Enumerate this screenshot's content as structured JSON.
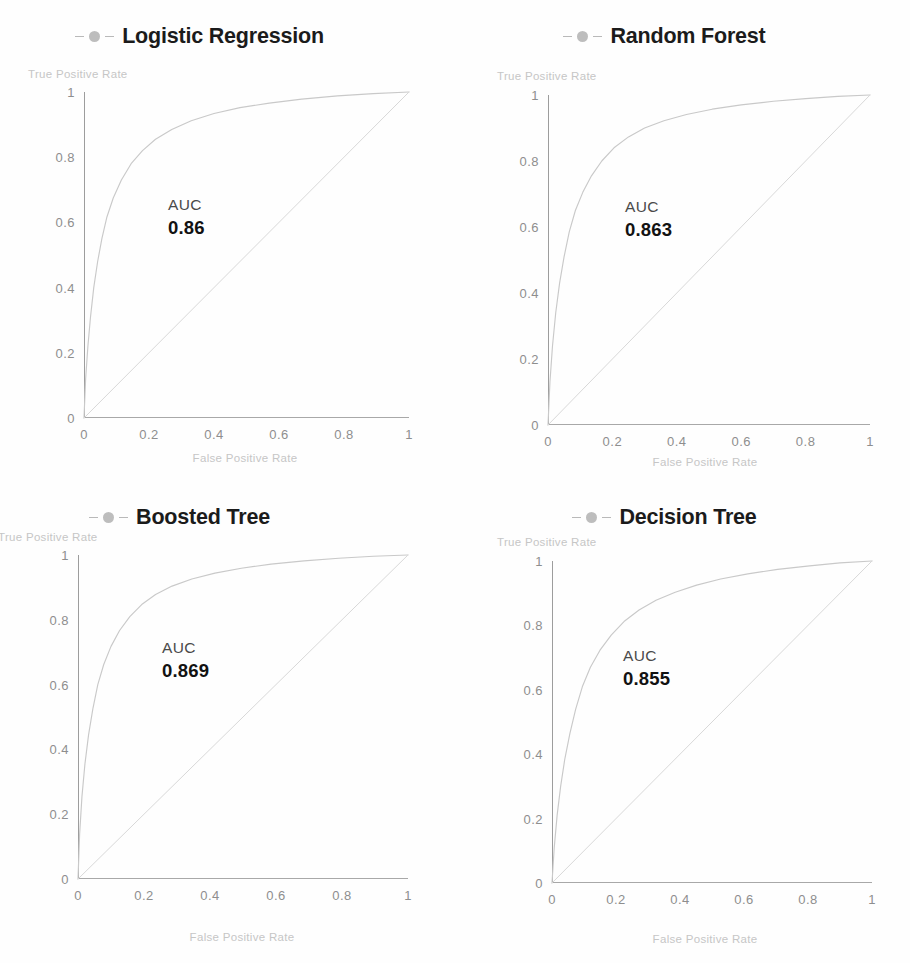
{
  "figure": {
    "background": "#ffffff",
    "curve_color": "#c9c9c9",
    "diagonal_color": "#d8d8d8",
    "axis_color": "#9d9d9d",
    "tick_color": "#8e8e8e",
    "axis_label_color": "#c6c6c6",
    "legend_marker_color": "#b2b2b2",
    "auc_label": "AUC"
  },
  "chart_data": [
    {
      "type": "line",
      "title": "Logistic Regression",
      "xlabel": "False Positive Rate",
      "ylabel": "True Positive Rate",
      "xlim": [
        0,
        1
      ],
      "ylim": [
        0,
        1
      ],
      "xticks": [
        "0",
        "0.2",
        "0.4",
        "0.6",
        "0.8",
        "1"
      ],
      "yticks": [
        "0",
        "0.2",
        "0.4",
        "0.6",
        "0.8",
        "1"
      ],
      "grid": false,
      "legend_position": "top-center",
      "annotations": {
        "auc_label": "AUC",
        "auc_value": "0.86"
      },
      "series": [
        {
          "name": "ROC curve",
          "x": [
            0,
            0.005,
            0.012,
            0.02,
            0.03,
            0.042,
            0.055,
            0.07,
            0.09,
            0.115,
            0.145,
            0.18,
            0.22,
            0.27,
            0.33,
            0.4,
            0.48,
            0.57,
            0.67,
            0.78,
            0.89,
            1.0
          ],
          "y": [
            0,
            0.12,
            0.22,
            0.31,
            0.4,
            0.48,
            0.55,
            0.615,
            0.675,
            0.73,
            0.78,
            0.82,
            0.855,
            0.885,
            0.912,
            0.934,
            0.952,
            0.966,
            0.978,
            0.988,
            0.995,
            1.0
          ]
        },
        {
          "name": "Chance diagonal",
          "x": [
            0,
            1
          ],
          "y": [
            0,
            1
          ]
        }
      ]
    },
    {
      "type": "line",
      "title": "Random Forest",
      "xlabel": "False Positive Rate",
      "ylabel": "True Positive Rate",
      "xlim": [
        0,
        1
      ],
      "ylim": [
        0,
        1
      ],
      "xticks": [
        "0",
        "0.2",
        "0.4",
        "0.6",
        "0.8",
        "1"
      ],
      "yticks": [
        "0",
        "0.2",
        "0.4",
        "0.6",
        "0.8",
        "1"
      ],
      "grid": false,
      "legend_position": "top-center",
      "annotations": {
        "auc_label": "AUC",
        "auc_value": "0.863"
      },
      "series": [
        {
          "name": "ROC curve",
          "x": [
            0,
            0.006,
            0.014,
            0.024,
            0.036,
            0.05,
            0.066,
            0.085,
            0.108,
            0.135,
            0.167,
            0.205,
            0.25,
            0.3,
            0.36,
            0.43,
            0.51,
            0.6,
            0.7,
            0.8,
            0.9,
            1.0
          ],
          "y": [
            0,
            0.13,
            0.24,
            0.34,
            0.43,
            0.51,
            0.585,
            0.65,
            0.705,
            0.755,
            0.8,
            0.84,
            0.873,
            0.9,
            0.922,
            0.941,
            0.957,
            0.97,
            0.981,
            0.989,
            0.996,
            1.0
          ]
        },
        {
          "name": "Chance diagonal",
          "x": [
            0,
            1
          ],
          "y": [
            0,
            1
          ]
        }
      ]
    },
    {
      "type": "line",
      "title": "Boosted Tree",
      "xlabel": "False Positive Rate",
      "ylabel": "True Positive Rate",
      "xlim": [
        0,
        1
      ],
      "ylim": [
        0,
        1
      ],
      "xticks": [
        "0",
        "0.2",
        "0.4",
        "0.6",
        "0.8",
        "1"
      ],
      "yticks": [
        "0",
        "0.2",
        "0.4",
        "0.6",
        "0.8",
        "1"
      ],
      "grid": false,
      "legend_position": "top-center",
      "annotations": {
        "auc_label": "AUC",
        "auc_value": "0.869"
      },
      "series": [
        {
          "name": "ROC curve",
          "x": [
            0,
            0.005,
            0.012,
            0.021,
            0.032,
            0.045,
            0.06,
            0.078,
            0.1,
            0.126,
            0.157,
            0.193,
            0.235,
            0.285,
            0.345,
            0.415,
            0.495,
            0.585,
            0.685,
            0.79,
            0.895,
            1.0
          ],
          "y": [
            0,
            0.14,
            0.255,
            0.355,
            0.445,
            0.525,
            0.6,
            0.662,
            0.718,
            0.767,
            0.81,
            0.847,
            0.878,
            0.904,
            0.926,
            0.944,
            0.959,
            0.972,
            0.982,
            0.99,
            0.996,
            1.0
          ]
        },
        {
          "name": "Chance diagonal",
          "x": [
            0,
            1
          ],
          "y": [
            0,
            1
          ]
        }
      ]
    },
    {
      "type": "line",
      "title": "Decision Tree",
      "xlabel": "False Positive Rate",
      "ylabel": "True Positive Rate",
      "xlim": [
        0,
        1
      ],
      "ylim": [
        0,
        1
      ],
      "xticks": [
        "0",
        "0.2",
        "0.4",
        "0.6",
        "0.8",
        "1"
      ],
      "yticks": [
        "0",
        "0.2",
        "0.4",
        "0.6",
        "0.8",
        "1"
      ],
      "grid": false,
      "legend_position": "top-center",
      "annotations": {
        "auc_label": "AUC",
        "auc_value": "0.855"
      },
      "series": [
        {
          "name": "ROC curve",
          "x": [
            0,
            0.007,
            0.016,
            0.027,
            0.04,
            0.056,
            0.074,
            0.095,
            0.12,
            0.15,
            0.185,
            0.225,
            0.272,
            0.325,
            0.385,
            0.452,
            0.527,
            0.612,
            0.705,
            0.805,
            0.9,
            1.0
          ],
          "y": [
            0,
            0.11,
            0.21,
            0.3,
            0.385,
            0.465,
            0.54,
            0.61,
            0.67,
            0.723,
            0.77,
            0.812,
            0.848,
            0.878,
            0.903,
            0.925,
            0.944,
            0.96,
            0.974,
            0.985,
            0.994,
            1.0
          ]
        },
        {
          "name": "Chance diagonal",
          "x": [
            0,
            1
          ],
          "y": [
            0,
            1
          ]
        }
      ]
    }
  ]
}
